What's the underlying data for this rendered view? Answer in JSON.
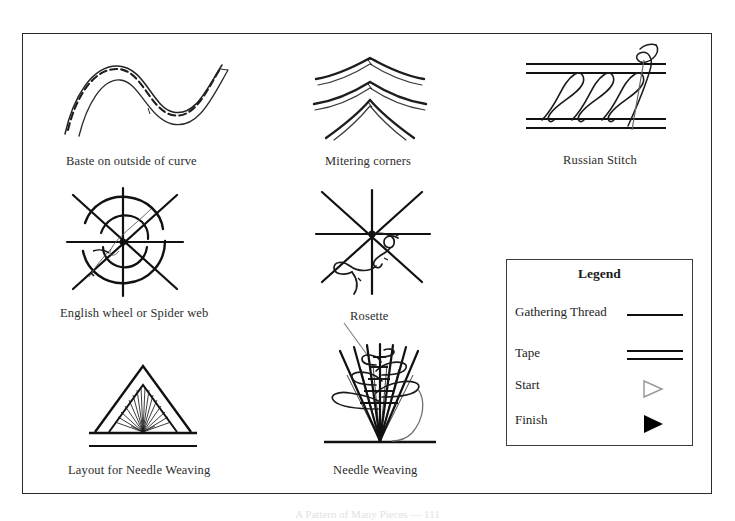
{
  "page": {
    "background_color": "#ffffff",
    "border_color": "#2b2b2b",
    "ink_color": "#1a1a1a",
    "bottom_caption": "A Pattern of Many Pieces — 111"
  },
  "figures": [
    {
      "id": "baste-on-outside-of-curve",
      "caption": "Baste on outside of curve",
      "description": "S-shaped tape curve with a dashed gathering/basting thread running along the outer edge"
    },
    {
      "id": "mitering-corners",
      "caption": "Mitering corners",
      "description": "Three nested chevron shapes showing tape folded and mitered at a point"
    },
    {
      "id": "russian-stitch",
      "caption": "Russian Stitch",
      "description": "Two parallel tape bands joined by a criss-cross looping stitch with needle thread at right"
    },
    {
      "id": "english-wheel-or-spider-web",
      "caption": "English wheel or Spider web",
      "description": "Eight radiating spokes with two concentric woven spiral rings at the centre"
    },
    {
      "id": "rosette",
      "caption": "Rosette",
      "description": "Eight radiating spokes with a thread looping around the centre, labelled with a leader line"
    },
    {
      "id": "layout-for-needle-weaving",
      "caption": "Layout for Needle Weaving",
      "description": "Nested triangles with a fan of fine threads radiating from the base apex"
    },
    {
      "id": "needle-weaving",
      "caption": "Needle Weaving",
      "description": "A splayed fan of threads converging at a base bar with horizontal weaving loops, rosette at top"
    }
  ],
  "legend": {
    "title": "Legend",
    "items": [
      {
        "label": "Gathering Thread",
        "symbol": "single-line",
        "color": "#0f0f0f"
      },
      {
        "label": "Tape",
        "symbol": "double-line",
        "color": "#0f0f0f"
      },
      {
        "label": "Start",
        "symbol": "open-triangle",
        "color": "#9a9a9a"
      },
      {
        "label": "Finish",
        "symbol": "solid-triangle",
        "color": "#000000"
      }
    ]
  }
}
